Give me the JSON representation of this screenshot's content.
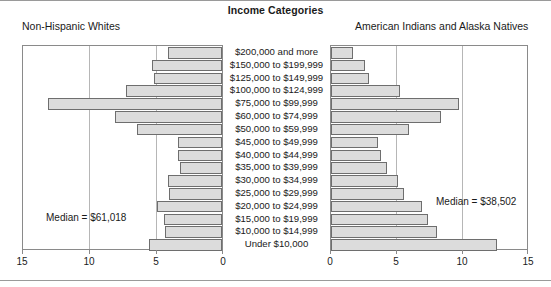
{
  "chart_data": {
    "type": "bar",
    "subtype": "population-pyramid",
    "title": "Income Categories",
    "xlabel": "",
    "ylabel": "",
    "xlim": [
      0,
      15
    ],
    "grid": true,
    "legend_position": "panel-titles",
    "categories": [
      "$200,000 and more",
      "$150,000 to $199,999",
      "$125,000 to $149,999",
      "$100,000 to $124,999",
      "$75,000 to $99,999",
      "$60,000 to $74,999",
      "$50,000 to $59,999",
      "$45,000 to $49,999",
      "$40,000 to $44,999",
      "$35,000 to $39,999",
      "$30,000 to $34,999",
      "$25,000 to $29,999",
      "$20,000 to $24,999",
      "$15,000 to $19,999",
      "$10,000 to $14,999",
      "Under $10,000"
    ],
    "series": [
      {
        "name": "Non-Hispanic Whites",
        "side": "left",
        "values": [
          4.1,
          5.3,
          5.1,
          7.2,
          13.1,
          8.1,
          6.4,
          3.3,
          3.3,
          3.2,
          4.1,
          4.0,
          4.9,
          4.4,
          4.3,
          5.5
        ]
      },
      {
        "name": "American Indians and Alaska Natives",
        "side": "right",
        "values": [
          1.7,
          2.6,
          2.9,
          5.3,
          9.8,
          8.4,
          6.0,
          3.6,
          3.8,
          4.3,
          5.1,
          5.6,
          7.0,
          7.4,
          8.1,
          12.7
        ]
      }
    ],
    "annotations": [
      {
        "name": "left-median",
        "text": "Median = $61,018",
        "side": "left"
      },
      {
        "name": "right-median",
        "text": "Median = $38,502",
        "side": "right"
      }
    ],
    "axes": {
      "left": {
        "ticks": [
          15,
          10,
          5,
          0
        ],
        "direction": "reversed"
      },
      "right": {
        "ticks": [
          0,
          5,
          10,
          15
        ],
        "direction": "normal"
      }
    }
  },
  "header": {
    "title": "Income Categories",
    "left_panel": "Non-Hispanic Whites",
    "right_panel": "American Indians and Alaska Natives"
  },
  "left_axis": {
    "t0": "15",
    "t1": "10",
    "t2": "5",
    "t3": "0"
  },
  "right_axis": {
    "t0": "0",
    "t1": "5",
    "t2": "10",
    "t3": "15"
  },
  "medians": {
    "left": "Median = $61,018",
    "right": "Median = $38,502"
  }
}
